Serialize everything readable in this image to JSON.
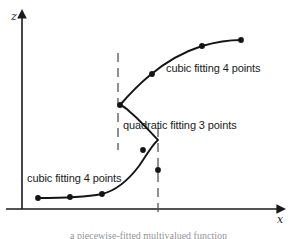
{
  "figure": {
    "background_color": "#ffffff",
    "ink_color": "#1a1a1a",
    "guide_color": "#555555",
    "axes": {
      "x_label": "x",
      "z_label": "z",
      "x_axis_y": 209,
      "y_axis_x": 22,
      "x_axis_end": 283,
      "y_axis_top": 12
    },
    "annotations": [
      {
        "id": "label-cubic-upper",
        "text": "cubic fitting 4 points",
        "x": 166,
        "y": 72
      },
      {
        "id": "label-quadratic",
        "text": "quadratic fitting 3 points",
        "x": 123,
        "y": 129
      },
      {
        "id": "label-cubic-lower",
        "text": "cubic fitting 4 points",
        "x": 27,
        "y": 182
      }
    ],
    "guides": [
      {
        "id": "guide-left",
        "x": 118,
        "y1": 53,
        "y2": 150
      },
      {
        "id": "guide-right",
        "x": 158,
        "y1": 128,
        "y2": 218
      }
    ],
    "curve_path": "M 38,198 C 60,198 86,197 102,194 C 118,190 130,178 139,166 C 146,156 152,145 158,140 C 150,132 140,120 130,112 C 126,108 123,106 120,105 C 127,97 137,86 149,76 C 163,64 180,53 202,46 C 216,42 230,40 241,40"
  },
  "chart_data": {
    "type": "scatter",
    "title": "",
    "xlabel": "x",
    "ylabel": "z",
    "grid": false,
    "legend": "none",
    "series": [
      {
        "name": "cubic fitting 4 points (lower branch)",
        "annotation": "cubic fitting 4 points",
        "points": [
          {
            "x": 38,
            "y": 198
          },
          {
            "x": 70,
            "y": 197
          },
          {
            "x": 102,
            "y": 194
          },
          {
            "x": 158,
            "y": 170
          }
        ]
      },
      {
        "name": "quadratic fitting 3 points (middle branch)",
        "annotation": "quadratic fitting 3 points",
        "points": [
          {
            "x": 158,
            "y": 170
          },
          {
            "x": 143,
            "y": 150
          },
          {
            "x": 120,
            "y": 105
          }
        ]
      },
      {
        "name": "cubic fitting 4 points (upper branch)",
        "annotation": "cubic fitting 4 points",
        "points": [
          {
            "x": 120,
            "y": 105
          },
          {
            "x": 152,
            "y": 74
          },
          {
            "x": 202,
            "y": 46
          },
          {
            "x": 241,
            "y": 40
          }
        ]
      }
    ],
    "marker_points": [
      {
        "id": "p1",
        "x": 38,
        "y": 198
      },
      {
        "id": "p2",
        "x": 70,
        "y": 197
      },
      {
        "id": "p3",
        "x": 102,
        "y": 194
      },
      {
        "id": "p4",
        "x": 143,
        "y": 150
      },
      {
        "id": "p5",
        "x": 158,
        "y": 170
      },
      {
        "id": "p6",
        "x": 120,
        "y": 105
      },
      {
        "id": "p7",
        "x": 152,
        "y": 74
      },
      {
        "id": "p8",
        "x": 202,
        "y": 46
      },
      {
        "id": "p9",
        "x": 241,
        "y": 40
      }
    ]
  },
  "caption": {
    "text": "a piecewise-fitted multivalued function"
  }
}
